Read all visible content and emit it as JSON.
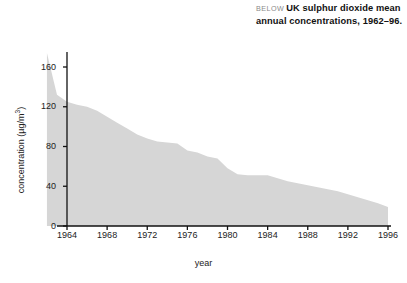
{
  "caption": {
    "kicker": "BELOW",
    "text": "UK sulphur dioxide mean annual concentrations, 1962–96."
  },
  "chart_data": {
    "type": "area",
    "title": "UK sulphur dioxide mean annual concentrations, 1962–96.",
    "xlabel": "year",
    "ylabel": "concentration (µg/m³)",
    "xlim": [
      1962,
      1996
    ],
    "ylim": [
      0,
      175
    ],
    "grid": false,
    "legend": false,
    "series_name": "UK SO2 mean annual concentration",
    "fill_color": "#d6d6d6",
    "axis_color": "#111111",
    "x": [
      1962,
      1963,
      1964,
      1965,
      1966,
      1967,
      1968,
      1969,
      1970,
      1971,
      1972,
      1973,
      1974,
      1975,
      1976,
      1977,
      1978,
      1979,
      1980,
      1981,
      1982,
      1983,
      1984,
      1985,
      1986,
      1987,
      1988,
      1989,
      1990,
      1991,
      1992,
      1993,
      1994,
      1995,
      1996
    ],
    "values": [
      174,
      132,
      125,
      122,
      120,
      116,
      110,
      104,
      98,
      92,
      88,
      85,
      84,
      83,
      76,
      74,
      70,
      68,
      58,
      52,
      51,
      51,
      51,
      48,
      45,
      43,
      41,
      39,
      37,
      35,
      32,
      29,
      26,
      23,
      19
    ],
    "xticks": [
      1964,
      1968,
      1972,
      1976,
      1980,
      1984,
      1988,
      1992,
      1996
    ],
    "yticks": [
      0,
      40,
      80,
      120,
      160
    ]
  },
  "axes": {
    "ylabel": "concentration (µg/m",
    "ylabel_sup": "3",
    "ylabel_close": ")",
    "xlabel": "year"
  }
}
